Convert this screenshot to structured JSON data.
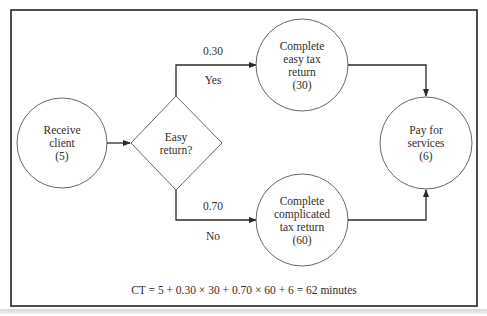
{
  "diagram": {
    "type": "process-flow",
    "nodes": [
      {
        "id": "receive",
        "shape": "circle",
        "lines": [
          "Receive",
          "client",
          "(5)"
        ],
        "label": "Receive client",
        "time": 5
      },
      {
        "id": "decision",
        "shape": "diamond",
        "lines": [
          "Easy",
          "return?"
        ],
        "label": "Easy return?"
      },
      {
        "id": "easy",
        "shape": "circle",
        "lines": [
          "Complete",
          "easy tax",
          "return",
          "(30)"
        ],
        "label": "Complete easy tax return",
        "time": 30
      },
      {
        "id": "complicated",
        "shape": "circle",
        "lines": [
          "Complete",
          "complicated",
          "tax return",
          "(60)"
        ],
        "label": "Complete complicated tax return",
        "time": 60
      },
      {
        "id": "pay",
        "shape": "circle",
        "lines": [
          "Pay for",
          "services",
          "(6)"
        ],
        "label": "Pay for services",
        "time": 6
      }
    ],
    "edges": [
      {
        "from": "receive",
        "to": "decision"
      },
      {
        "from": "decision",
        "to": "easy",
        "probability": "0.30",
        "label": "Yes"
      },
      {
        "from": "decision",
        "to": "complicated",
        "probability": "0.70",
        "label": "No"
      },
      {
        "from": "easy",
        "to": "pay"
      },
      {
        "from": "complicated",
        "to": "pay"
      }
    ],
    "formula": "CT = 5 + 0.30 × 30 + 0.70 × 60 + 6 = 62 minutes"
  },
  "colors": {
    "line": "#3a3a3a",
    "frame": "#222222",
    "text": "#2e2e2e",
    "background": "#ffffff"
  }
}
